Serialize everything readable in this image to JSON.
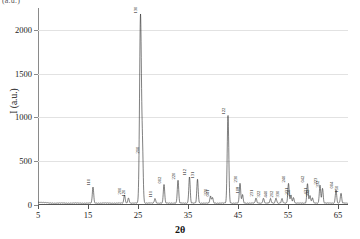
{
  "figure": {
    "corner_label": "(a.u.)",
    "ylabel": "I (a.u.)",
    "xlabel": "2θ"
  },
  "axes": {
    "y_ticks": [
      0,
      500,
      1000,
      1500,
      2000
    ],
    "x_ticks": [
      5,
      15,
      25,
      35,
      45,
      55,
      65
    ]
  },
  "chart_data": {
    "type": "line",
    "title": "",
    "xlabel": "2θ",
    "ylabel": "I (a.u.)",
    "xlim": [
      5,
      67
    ],
    "ylim": [
      0,
      2250
    ],
    "grid": true,
    "legend": "none",
    "baseline": 22,
    "peaks": [
      {
        "x": 16.0,
        "height": 185,
        "label": "110"
      },
      {
        "x": 22.3,
        "height": 92,
        "label": "200"
      },
      {
        "x": 23.1,
        "height": 58,
        "label": "120"
      },
      {
        "x": 25.5,
        "height": 2150,
        "label": "130"
      },
      {
        "x": 25.9,
        "height": 560,
        "label": "210"
      },
      {
        "x": 28.4,
        "height": 52,
        "label": "111"
      },
      {
        "x": 30.2,
        "height": 215,
        "label": "002"
      },
      {
        "x": 33.0,
        "height": 262,
        "label": "220"
      },
      {
        "x": 35.3,
        "height": 300,
        "label": "112"
      },
      {
        "x": 36.9,
        "height": 272,
        "label": "131"
      },
      {
        "x": 39.5,
        "height": 78,
        "label": "320"
      },
      {
        "x": 39.9,
        "height": 62,
        "label": "041"
      },
      {
        "x": 43.0,
        "height": 1005,
        "label": "122"
      },
      {
        "x": 45.4,
        "height": 228,
        "label": "230"
      },
      {
        "x": 45.9,
        "height": 96,
        "label": "108"
      },
      {
        "x": 48.6,
        "height": 58,
        "label": "231"
      },
      {
        "x": 50.1,
        "height": 54,
        "label": "322"
      },
      {
        "x": 51.5,
        "height": 50,
        "label": "440"
      },
      {
        "x": 52.6,
        "height": 56,
        "label": "212"
      },
      {
        "x": 53.8,
        "height": 52,
        "label": "330"
      },
      {
        "x": 55.1,
        "height": 225,
        "label": "240"
      },
      {
        "x": 55.6,
        "height": 90,
        "label": "331"
      },
      {
        "x": 56.1,
        "height": 62,
        "label": "250"
      },
      {
        "x": 58.9,
        "height": 222,
        "label": "042"
      },
      {
        "x": 59.4,
        "height": 86,
        "label": "421"
      },
      {
        "x": 59.9,
        "height": 60,
        "label": "332"
      },
      {
        "x": 61.4,
        "height": 205,
        "label": "223"
      },
      {
        "x": 61.9,
        "height": 170,
        "label": "332"
      },
      {
        "x": 64.6,
        "height": 150,
        "label": "004"
      },
      {
        "x": 65.6,
        "height": 112,
        "label": "150"
      }
    ]
  }
}
